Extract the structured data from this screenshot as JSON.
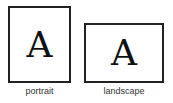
{
  "diagram": {
    "portrait": {
      "glyph": "A",
      "label": "portrait"
    },
    "landscape": {
      "glyph": "A",
      "label": "landscape"
    }
  }
}
